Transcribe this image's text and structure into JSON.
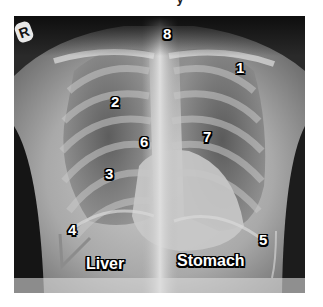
{
  "caption": {
    "partial_top_text": "y"
  },
  "image": {
    "type": "chest-xray-pa",
    "side_marker": "R",
    "labels": [
      {
        "id": "1",
        "text": "1",
        "x": 222,
        "y": 60
      },
      {
        "id": "2",
        "text": "2",
        "x": 97,
        "y": 94
      },
      {
        "id": "3",
        "text": "3",
        "x": 91,
        "y": 166
      },
      {
        "id": "4",
        "text": "4",
        "x": 54,
        "y": 222
      },
      {
        "id": "5",
        "text": "5",
        "x": 245,
        "y": 232
      },
      {
        "id": "6",
        "text": "6",
        "x": 126,
        "y": 134
      },
      {
        "id": "7",
        "text": "7",
        "x": 189,
        "y": 129
      },
      {
        "id": "8",
        "text": "8",
        "x": 155,
        "y": 26
      }
    ],
    "organs": [
      {
        "text": "Liver",
        "x": 86,
        "y": 256
      },
      {
        "text": "Stomach",
        "x": 177,
        "y": 253
      }
    ],
    "colors": {
      "background": "#ffffff",
      "film_dark": "#1a1a1a",
      "label_fill": "#ffffff",
      "label_stroke": "#000000"
    }
  }
}
